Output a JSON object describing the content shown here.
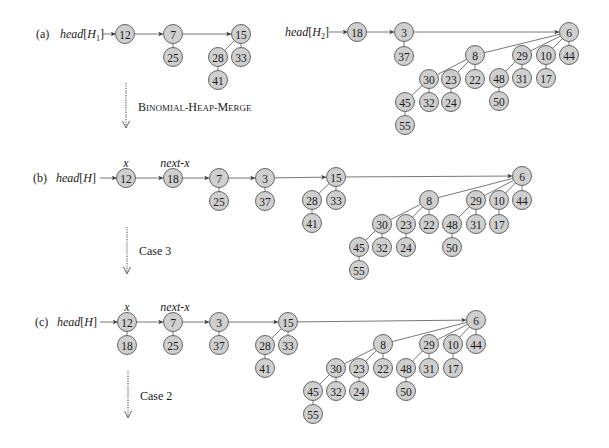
{
  "style": {
    "node_fill": "#cfcfcf",
    "node_stroke": "#555555",
    "edge_color": "#555555",
    "text_color": "#1a1a1a",
    "node_radius": 9.5
  },
  "panels": [
    {
      "id": "a",
      "label": "(a)",
      "label_pos": [
        36,
        38
      ],
      "heads": [
        {
          "text": "head",
          "sub": "1",
          "bracket_var": "H",
          "pos": [
            60,
            38
          ],
          "arrow_from": [
            103,
            34
          ],
          "arrow_to": [
            115.5,
            34
          ]
        },
        {
          "text": "head",
          "sub": "2",
          "bracket_var": "H",
          "pos": [
            285,
            36
          ],
          "arrow_from": [
            329,
            32
          ],
          "arrow_to": [
            347.5,
            32
          ]
        }
      ],
      "pointer_labels": [],
      "nodes": [
        {
          "id": "a12",
          "key": "12",
          "x": 125,
          "y": 34
        },
        {
          "id": "a7",
          "key": "7",
          "x": 173,
          "y": 34
        },
        {
          "id": "a25",
          "key": "25",
          "x": 173,
          "y": 57
        },
        {
          "id": "a15",
          "key": "15",
          "x": 241,
          "y": 34
        },
        {
          "id": "a28",
          "key": "28",
          "x": 218,
          "y": 57
        },
        {
          "id": "a33",
          "key": "33",
          "x": 241,
          "y": 57
        },
        {
          "id": "a41",
          "key": "41",
          "x": 218,
          "y": 80
        },
        {
          "id": "a18",
          "key": "18",
          "x": 357,
          "y": 32
        },
        {
          "id": "a3",
          "key": "3",
          "x": 404,
          "y": 32
        },
        {
          "id": "a37",
          "key": "37",
          "x": 404,
          "y": 56
        },
        {
          "id": "a6",
          "key": "6",
          "x": 569,
          "y": 32
        },
        {
          "id": "a8",
          "key": "8",
          "x": 475,
          "y": 55
        },
        {
          "id": "a29",
          "key": "29",
          "x": 522,
          "y": 55
        },
        {
          "id": "a10",
          "key": "10",
          "x": 546,
          "y": 55
        },
        {
          "id": "a44",
          "key": "44",
          "x": 569,
          "y": 55
        },
        {
          "id": "a30",
          "key": "30",
          "x": 429,
          "y": 79
        },
        {
          "id": "a23",
          "key": "23",
          "x": 451,
          "y": 79
        },
        {
          "id": "a22",
          "key": "22",
          "x": 475,
          "y": 79
        },
        {
          "id": "a48",
          "key": "48",
          "x": 499,
          "y": 78
        },
        {
          "id": "a31",
          "key": "31",
          "x": 522,
          "y": 78
        },
        {
          "id": "a17",
          "key": "17",
          "x": 546,
          "y": 78
        },
        {
          "id": "a45",
          "key": "45",
          "x": 405,
          "y": 102
        },
        {
          "id": "a32",
          "key": "32",
          "x": 429,
          "y": 102
        },
        {
          "id": "a24",
          "key": "24",
          "x": 451,
          "y": 102
        },
        {
          "id": "a50",
          "key": "50",
          "x": 499,
          "y": 101
        },
        {
          "id": "a55",
          "key": "55",
          "x": 405,
          "y": 125
        }
      ],
      "tree_edges": [
        [
          "a7",
          "a25"
        ],
        [
          "a15",
          "a28"
        ],
        [
          "a15",
          "a33"
        ],
        [
          "a28",
          "a41"
        ],
        [
          "a3",
          "a37"
        ],
        [
          "a6",
          "a8"
        ],
        [
          "a6",
          "a29"
        ],
        [
          "a6",
          "a10"
        ],
        [
          "a6",
          "a44"
        ],
        [
          "a8",
          "a30"
        ],
        [
          "a8",
          "a23"
        ],
        [
          "a8",
          "a22"
        ],
        [
          "a29",
          "a48"
        ],
        [
          "a29",
          "a31"
        ],
        [
          "a10",
          "a17"
        ],
        [
          "a30",
          "a45"
        ],
        [
          "a30",
          "a32"
        ],
        [
          "a23",
          "a24"
        ],
        [
          "a48",
          "a50"
        ],
        [
          "a45",
          "a55"
        ]
      ],
      "root_links": [
        [
          "a12",
          "a7"
        ],
        [
          "a7",
          "a15"
        ],
        [
          "a18",
          "a3"
        ],
        [
          "a3",
          "a6"
        ]
      ],
      "transition": {
        "x": 126,
        "y1": 83,
        "y2": 127,
        "label": "Binomial-Heap-Merge",
        "label_pos": [
          138,
          111
        ],
        "smallcaps": true
      }
    },
    {
      "id": "b",
      "label": "(b)",
      "label_pos": [
        33,
        182
      ],
      "heads": [
        {
          "text": "head",
          "sub": "",
          "bracket_var": "H",
          "pos": [
            56,
            182
          ],
          "arrow_from": [
            100,
            178
          ],
          "arrow_to": [
            116.5,
            178
          ]
        }
      ],
      "pointer_labels": [
        {
          "text": "x",
          "x": 126,
          "y": 167
        },
        {
          "text": "next-x",
          "x": 175,
          "y": 167
        }
      ],
      "nodes": [
        {
          "id": "b12",
          "key": "12",
          "x": 126,
          "y": 178
        },
        {
          "id": "b18",
          "key": "18",
          "x": 173,
          "y": 178
        },
        {
          "id": "b7",
          "key": "7",
          "x": 219,
          "y": 178
        },
        {
          "id": "b25",
          "key": "25",
          "x": 219,
          "y": 201
        },
        {
          "id": "b3",
          "key": "3",
          "x": 265,
          "y": 178
        },
        {
          "id": "b37",
          "key": "37",
          "x": 265,
          "y": 201
        },
        {
          "id": "b15",
          "key": "15",
          "x": 336,
          "y": 177
        },
        {
          "id": "b28",
          "key": "28",
          "x": 312,
          "y": 200
        },
        {
          "id": "b33",
          "key": "33",
          "x": 336,
          "y": 200
        },
        {
          "id": "b41",
          "key": "41",
          "x": 312,
          "y": 223
        },
        {
          "id": "b6",
          "key": "6",
          "x": 522,
          "y": 176
        },
        {
          "id": "b8",
          "key": "8",
          "x": 429,
          "y": 200
        },
        {
          "id": "b29",
          "key": "29",
          "x": 476,
          "y": 200
        },
        {
          "id": "b10",
          "key": "10",
          "x": 499,
          "y": 200
        },
        {
          "id": "b44",
          "key": "44",
          "x": 522,
          "y": 200
        },
        {
          "id": "b30",
          "key": "30",
          "x": 382,
          "y": 224
        },
        {
          "id": "b23",
          "key": "23",
          "x": 406,
          "y": 224
        },
        {
          "id": "b22",
          "key": "22",
          "x": 429,
          "y": 224
        },
        {
          "id": "b48",
          "key": "48",
          "x": 452,
          "y": 224
        },
        {
          "id": "b31",
          "key": "31",
          "x": 476,
          "y": 224
        },
        {
          "id": "b17",
          "key": "17",
          "x": 499,
          "y": 224
        },
        {
          "id": "b45",
          "key": "45",
          "x": 359,
          "y": 247
        },
        {
          "id": "b32",
          "key": "32",
          "x": 382,
          "y": 247
        },
        {
          "id": "b24",
          "key": "24",
          "x": 406,
          "y": 247
        },
        {
          "id": "b50",
          "key": "50",
          "x": 452,
          "y": 247
        },
        {
          "id": "b55",
          "key": "55",
          "x": 359,
          "y": 270
        }
      ],
      "tree_edges": [
        [
          "b7",
          "b25"
        ],
        [
          "b3",
          "b37"
        ],
        [
          "b15",
          "b28"
        ],
        [
          "b15",
          "b33"
        ],
        [
          "b28",
          "b41"
        ],
        [
          "b6",
          "b8"
        ],
        [
          "b6",
          "b29"
        ],
        [
          "b6",
          "b10"
        ],
        [
          "b6",
          "b44"
        ],
        [
          "b8",
          "b30"
        ],
        [
          "b8",
          "b23"
        ],
        [
          "b8",
          "b22"
        ],
        [
          "b29",
          "b48"
        ],
        [
          "b29",
          "b31"
        ],
        [
          "b10",
          "b17"
        ],
        [
          "b30",
          "b45"
        ],
        [
          "b30",
          "b32"
        ],
        [
          "b23",
          "b24"
        ],
        [
          "b48",
          "b50"
        ],
        [
          "b45",
          "b55"
        ]
      ],
      "root_links": [
        [
          "b12",
          "b18"
        ],
        [
          "b18",
          "b7"
        ],
        [
          "b7",
          "b3"
        ],
        [
          "b3",
          "b15"
        ],
        [
          "b15",
          "b6"
        ]
      ],
      "transition": {
        "x": 127,
        "y1": 227,
        "y2": 273,
        "label": "Case 3",
        "label_pos": [
          139,
          255
        ],
        "smallcaps": false
      }
    },
    {
      "id": "c",
      "label": "(c)",
      "label_pos": [
        35,
        326
      ],
      "heads": [
        {
          "text": "head",
          "sub": "",
          "bracket_var": "H",
          "pos": [
            57,
            326
          ],
          "arrow_from": [
            100,
            322
          ],
          "arrow_to": [
            117.5,
            322
          ]
        }
      ],
      "pointer_labels": [
        {
          "text": "x",
          "x": 127,
          "y": 311
        },
        {
          "text": "next-x",
          "x": 175,
          "y": 311
        }
      ],
      "nodes": [
        {
          "id": "c12",
          "key": "12",
          "x": 127,
          "y": 322
        },
        {
          "id": "c18",
          "key": "18",
          "x": 127,
          "y": 345
        },
        {
          "id": "c7",
          "key": "7",
          "x": 173,
          "y": 322
        },
        {
          "id": "c25",
          "key": "25",
          "x": 173,
          "y": 345
        },
        {
          "id": "c3",
          "key": "3",
          "x": 219,
          "y": 322
        },
        {
          "id": "c37",
          "key": "37",
          "x": 219,
          "y": 345
        },
        {
          "id": "c15",
          "key": "15",
          "x": 288,
          "y": 322
        },
        {
          "id": "c28",
          "key": "28",
          "x": 265,
          "y": 345
        },
        {
          "id": "c33",
          "key": "33",
          "x": 288,
          "y": 345
        },
        {
          "id": "c41",
          "key": "41",
          "x": 265,
          "y": 368
        },
        {
          "id": "c6",
          "key": "6",
          "x": 476,
          "y": 320
        },
        {
          "id": "c8",
          "key": "8",
          "x": 383,
          "y": 344
        },
        {
          "id": "c29",
          "key": "29",
          "x": 429,
          "y": 344
        },
        {
          "id": "c10",
          "key": "10",
          "x": 453,
          "y": 344
        },
        {
          "id": "c44",
          "key": "44",
          "x": 476,
          "y": 344
        },
        {
          "id": "c30",
          "key": "30",
          "x": 336,
          "y": 368
        },
        {
          "id": "c23",
          "key": "23",
          "x": 359,
          "y": 368
        },
        {
          "id": "c22",
          "key": "22",
          "x": 383,
          "y": 368
        },
        {
          "id": "c48",
          "key": "48",
          "x": 406,
          "y": 368
        },
        {
          "id": "c31",
          "key": "31",
          "x": 429,
          "y": 368
        },
        {
          "id": "c17",
          "key": "17",
          "x": 453,
          "y": 368
        },
        {
          "id": "c45",
          "key": "45",
          "x": 313,
          "y": 391
        },
        {
          "id": "c32",
          "key": "32",
          "x": 336,
          "y": 391
        },
        {
          "id": "c24",
          "key": "24",
          "x": 359,
          "y": 391
        },
        {
          "id": "c50",
          "key": "50",
          "x": 406,
          "y": 391
        },
        {
          "id": "c55",
          "key": "55",
          "x": 313,
          "y": 414
        }
      ],
      "tree_edges": [
        [
          "c12",
          "c18"
        ],
        [
          "c7",
          "c25"
        ],
        [
          "c3",
          "c37"
        ],
        [
          "c15",
          "c28"
        ],
        [
          "c15",
          "c33"
        ],
        [
          "c28",
          "c41"
        ],
        [
          "c6",
          "c8"
        ],
        [
          "c6",
          "c29"
        ],
        [
          "c6",
          "c10"
        ],
        [
          "c6",
          "c44"
        ],
        [
          "c8",
          "c30"
        ],
        [
          "c8",
          "c23"
        ],
        [
          "c8",
          "c22"
        ],
        [
          "c29",
          "c48"
        ],
        [
          "c29",
          "c31"
        ],
        [
          "c10",
          "c17"
        ],
        [
          "c30",
          "c45"
        ],
        [
          "c30",
          "c32"
        ],
        [
          "c23",
          "c24"
        ],
        [
          "c48",
          "c50"
        ],
        [
          "c45",
          "c55"
        ]
      ],
      "root_links": [
        [
          "c12",
          "c7"
        ],
        [
          "c7",
          "c3"
        ],
        [
          "c3",
          "c15"
        ],
        [
          "c15",
          "c6"
        ]
      ],
      "transition": {
        "x": 128,
        "y1": 371,
        "y2": 417,
        "label": "Case 2",
        "label_pos": [
          140,
          400
        ],
        "smallcaps": false
      }
    }
  ]
}
